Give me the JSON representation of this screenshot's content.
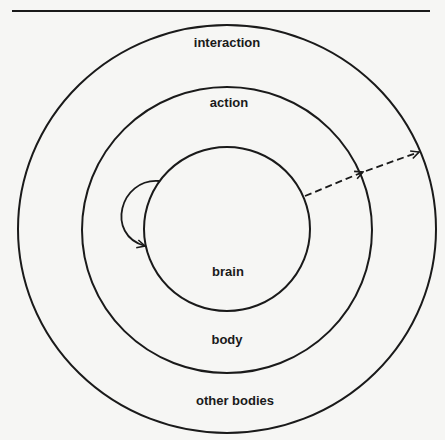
{
  "diagram": {
    "rings": [
      {
        "name": "outer",
        "label": "interaction",
        "bottom_label": "other bodies"
      },
      {
        "name": "middle",
        "label": "action",
        "bottom_label": "body"
      },
      {
        "name": "inner",
        "label": "",
        "bottom_label": "brain"
      }
    ],
    "labels": {
      "interaction": "interaction",
      "action": "action",
      "brain": "brain",
      "body": "body",
      "other_bodies": "other bodies"
    },
    "arrows": [
      {
        "name": "self-loop",
        "style": "solid",
        "from": "inner",
        "to": "inner"
      },
      {
        "name": "outward",
        "style": "dashed",
        "from": "inner",
        "to": "outer"
      }
    ],
    "colors": {
      "line": "#1a1a1a",
      "background": "#f6f6f4"
    }
  }
}
